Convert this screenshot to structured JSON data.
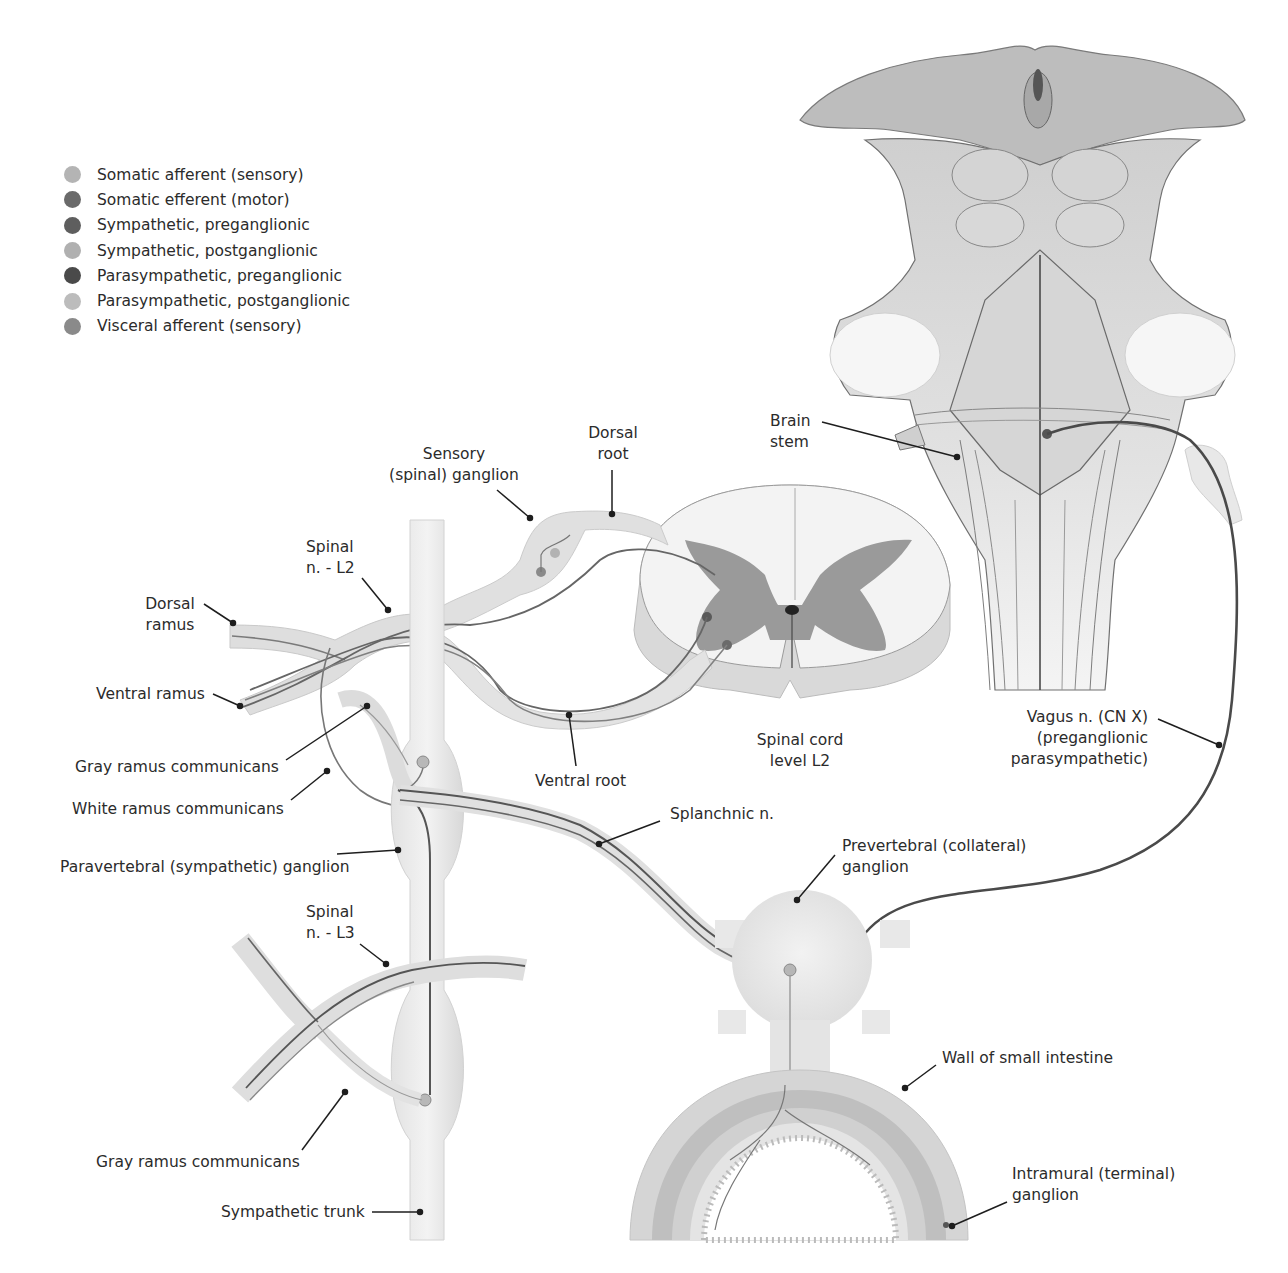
{
  "legend": {
    "items": [
      {
        "label": "Somatic afferent (sensory)",
        "color": "#b4b4b4"
      },
      {
        "label": "Somatic efferent (motor)",
        "color": "#6a6a6a"
      },
      {
        "label": "Sympathetic, preganglionic",
        "color": "#5e5e5e"
      },
      {
        "label": "Sympathetic, postganglionic",
        "color": "#b0b0b0"
      },
      {
        "label": "Parasympathetic, preganglionic",
        "color": "#4a4a4a"
      },
      {
        "label": "Parasympathetic, postganglionic",
        "color": "#bcbcbc"
      },
      {
        "label": "Visceral afferent (sensory)",
        "color": "#8a8a8a"
      }
    ]
  },
  "labels": {
    "sensory_ganglion": {
      "line1": "Sensory",
      "line2": "(spinal) ganglion"
    },
    "dorsal_root": {
      "line1": "Dorsal",
      "line2": "root"
    },
    "spinal_n_l2": {
      "line1": "Spinal",
      "line2": "n. - L2"
    },
    "dorsal_ramus": {
      "line1": "Dorsal",
      "line2": "ramus"
    },
    "ventral_ramus": "Ventral ramus",
    "gray_ramus_upper": "Gray ramus communicans",
    "white_ramus": "White ramus communicans",
    "paravertebral_ganglion": "Paravertebral (sympathetic) ganglion",
    "spinal_n_l3": {
      "line1": "Spinal",
      "line2": "n. - L3"
    },
    "gray_ramus_lower": "Gray ramus communicans",
    "sympathetic_trunk": "Sympathetic trunk",
    "ventral_root": "Ventral root",
    "spinal_cord_level": {
      "line1": "Spinal cord",
      "line2": "level L2"
    },
    "splanchnic_n": "Splanchnic n.",
    "brain_stem": {
      "line1": "Brain",
      "line2": "stem"
    },
    "vagus_n": {
      "line1": "Vagus n. (CN X)",
      "line2": "(preganglionic",
      "line3": "parasympathetic)"
    },
    "prevertebral_ganglion": {
      "line1": "Prevertebral (collateral)",
      "line2": "ganglion"
    },
    "wall_small_intestine": "Wall of small intestine",
    "intramural_ganglion": {
      "line1": "Intramural (terminal)",
      "line2": "ganglion"
    }
  },
  "colors": {
    "tissue_fill": "#e6e6e6",
    "tissue_edge": "#c8c8c8",
    "gray_matter": "#8f8f8f",
    "fiber_dark": "#555555",
    "fiber_light": "#9a9a9a",
    "leader": "#1e1e1e"
  }
}
